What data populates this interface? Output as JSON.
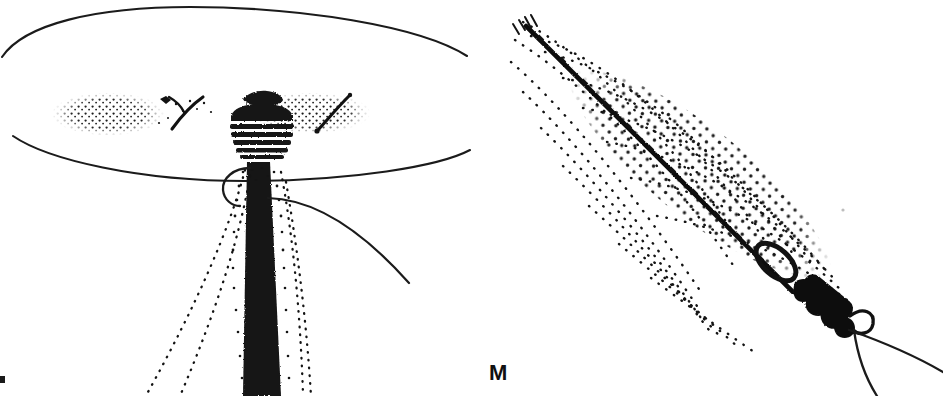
{
  "plate": {
    "width": 943,
    "height": 396,
    "background_color": "#ffffff",
    "ink_color": "#111111",
    "medium": "black-and-white line and stipple drawing",
    "panel_count": 2
  },
  "labels": {
    "figure_m": "M"
  },
  "panels": [
    {
      "id": "left-panel",
      "name": "upright-columnar-structure-with-ellipse",
      "description": "Upright dark tapering column rising into a banded capitate head, flanked by two stippled lateral lobes crossed by solid diagonal strokes, set against a large open ellipse outline.",
      "elements": [
        {
          "name": "large-ellipse-outline",
          "kind": "ellipse-arc-pair"
        },
        {
          "name": "central-column",
          "kind": "solid-tapering-shaft"
        },
        {
          "name": "banded-head",
          "kind": "ringed-capitulum"
        },
        {
          "name": "left-stippled-lobe",
          "kind": "stipple-field"
        },
        {
          "name": "right-stippled-lobe",
          "kind": "stipple-field"
        },
        {
          "name": "left-diagonal-stroke",
          "kind": "solid-line"
        },
        {
          "name": "right-diagonal-stroke",
          "kind": "solid-line"
        },
        {
          "name": "sweeping-right-arc",
          "kind": "curve"
        },
        {
          "name": "small-hook-loop",
          "kind": "curve"
        },
        {
          "name": "stipple-trails",
          "kind": "dotted-curves"
        },
        {
          "name": "edge-tick-mark",
          "kind": "mark"
        }
      ]
    },
    {
      "id": "right-panel",
      "name": "diagonal-lanceolate-stippled-blade",
      "description": "Lanceolate leaf-like blade rendered in arcing rows of stipple dots, bisected by a heavy diagonal midrib bearing small ticks, terminating at a dense knotted base with a hook and two fine curves.",
      "elements": [
        {
          "name": "lanceolate-stipple-blade",
          "kind": "stipple-field"
        },
        {
          "name": "diagonal-midrib",
          "kind": "heavy-solid-line"
        },
        {
          "name": "midrib-ticks",
          "kind": "tick-series"
        },
        {
          "name": "knot-cluster",
          "kind": "dense-solid-mass"
        },
        {
          "name": "open-link-loop",
          "kind": "outline-loop"
        },
        {
          "name": "terminal-hook",
          "kind": "curve"
        },
        {
          "name": "lower-straight-filament",
          "kind": "line"
        },
        {
          "name": "lower-curved-filament",
          "kind": "curve"
        }
      ]
    }
  ]
}
